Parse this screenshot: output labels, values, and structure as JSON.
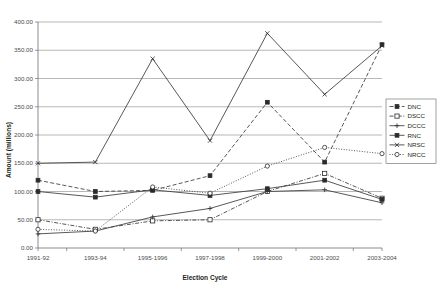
{
  "chart_data": {
    "type": "line",
    "title": "",
    "xlabel": "Election Cycle",
    "ylabel": "Amount (millions)",
    "categories": [
      "1991-92",
      "1993-94",
      "1995-1996",
      "1997-1998",
      "1999-2000",
      "2001-2002",
      "2003-2004"
    ],
    "ylim": [
      0,
      400
    ],
    "ytick_step": 50,
    "ytick_labels": [
      "0.00",
      "50.00",
      "100.00",
      "150.00",
      "200.00",
      "250.00",
      "300.00",
      "350.00",
      "400.00"
    ],
    "ytick_values": [
      0,
      50,
      100,
      150,
      200,
      250,
      300,
      350,
      400
    ],
    "grid": true,
    "legend_position": "right",
    "series": [
      {
        "name": "DNC",
        "marker": "filled-square",
        "dash": "dashed",
        "values": [
          120,
          100,
          102,
          128,
          258,
          152,
          360
        ]
      },
      {
        "name": "DSCC",
        "marker": "open-square",
        "dash": "dash-dot",
        "values": [
          50,
          33,
          48,
          50,
          100,
          132,
          88
        ]
      },
      {
        "name": "DCCC",
        "marker": "plus",
        "dash": "solid",
        "values": [
          25,
          30,
          55,
          70,
          100,
          103,
          80
        ]
      },
      {
        "name": "RNC",
        "marker": "filled-square",
        "dash": "solid",
        "values": [
          100,
          90,
          103,
          93,
          105,
          120,
          86
        ]
      },
      {
        "name": "NRSC",
        "marker": "cross",
        "dash": "solid",
        "values": [
          150,
          152,
          335,
          190,
          380,
          272,
          358
        ]
      },
      {
        "name": "NRCC",
        "marker": "open-circle",
        "dash": "dotted",
        "values": [
          33,
          30,
          108,
          97,
          145,
          178,
          167
        ]
      }
    ]
  }
}
